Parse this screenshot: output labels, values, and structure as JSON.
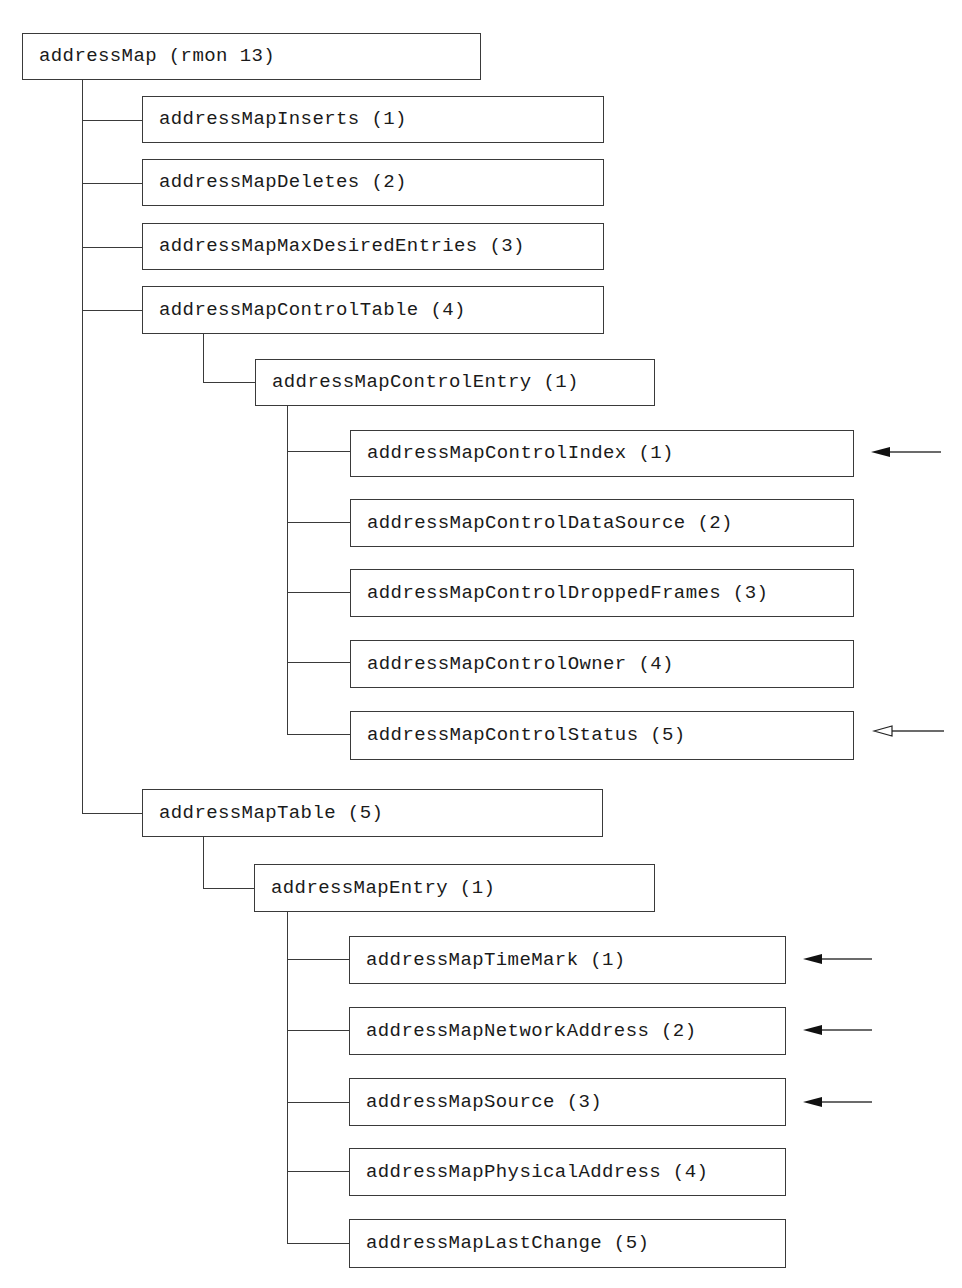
{
  "diagram": {
    "root": {
      "label": "addressMap (rmon 13)"
    },
    "level1": [
      {
        "label": "addressMapInserts (1)"
      },
      {
        "label": "addressMapDeletes (2)"
      },
      {
        "label": "addressMapMaxDesiredEntries (3)"
      },
      {
        "label": "addressMapControlTable (4)"
      },
      {
        "label": "addressMapTable (5)"
      }
    ],
    "controlEntry": {
      "label": "addressMapControlEntry (1)"
    },
    "controlColumns": [
      {
        "label": "addressMapControlIndex (1)",
        "arrow": "filled"
      },
      {
        "label": "addressMapControlDataSource (2)",
        "arrow": "none"
      },
      {
        "label": "addressMapControlDroppedFrames (3)",
        "arrow": "none"
      },
      {
        "label": "addressMapControlOwner (4)",
        "arrow": "none"
      },
      {
        "label": "addressMapControlStatus (5)",
        "arrow": "hollow"
      }
    ],
    "tableEntry": {
      "label": "addressMapEntry (1)"
    },
    "tableColumns": [
      {
        "label": "addressMapTimeMark (1)",
        "arrow": "filled"
      },
      {
        "label": "addressMapNetworkAddress (2)",
        "arrow": "filled"
      },
      {
        "label": "addressMapSource (3)",
        "arrow": "filled"
      },
      {
        "label": "addressMapPhysicalAddress (4)",
        "arrow": "none"
      },
      {
        "label": "addressMapLastChange (5)",
        "arrow": "none"
      }
    ],
    "colors": {
      "line": "#3a3a3a",
      "text": "#1a1a1a",
      "background": "#ffffff"
    }
  }
}
